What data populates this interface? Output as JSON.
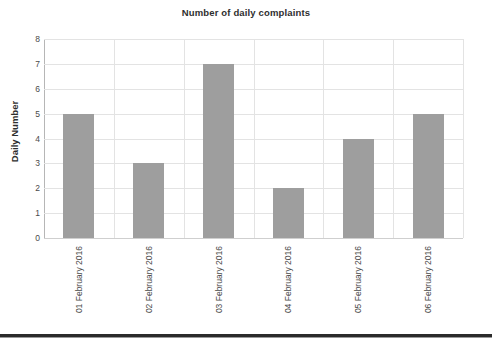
{
  "chart_data": {
    "type": "bar",
    "title": "Number of daily complaints",
    "xlabel": "",
    "ylabel": "Daily Number",
    "categories": [
      "01 February 2016",
      "02 February 2016",
      "03 February 2016",
      "04 February 2016",
      "05 February 2016",
      "06 February 2016"
    ],
    "values": [
      5,
      3,
      7,
      2,
      4,
      5
    ],
    "ylim": [
      0,
      8
    ],
    "ytick_step": 1,
    "yticks": [
      "8",
      "7",
      "6",
      "5",
      "4",
      "3",
      "2",
      "1",
      "0"
    ],
    "grid": true,
    "legend": false,
    "legend_position": "none",
    "bar_color": "#9e9e9e",
    "gridline_color": "#e3e3e3",
    "text_color": "#3b3b3b"
  }
}
